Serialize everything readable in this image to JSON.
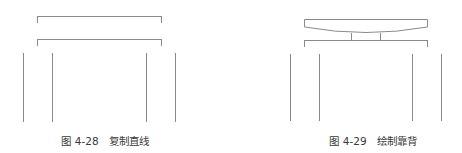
{
  "figures": [
    {
      "caption": "图 4-28   复制直线",
      "number": "4-28",
      "title": "复制直线",
      "elements": [
        "top-bracket",
        "second-bracket",
        "four-vertical-lines"
      ]
    },
    {
      "caption": "图 4-29   绘制靠背",
      "number": "4-29",
      "title": "绘制靠背",
      "elements": [
        "backrest-curved-shape",
        "two-short-posts",
        "bracket",
        "four-vertical-lines"
      ]
    }
  ],
  "colors": {
    "line": "#8a8a8a",
    "caption": "#3a3a3a",
    "background": "#ffffff"
  }
}
